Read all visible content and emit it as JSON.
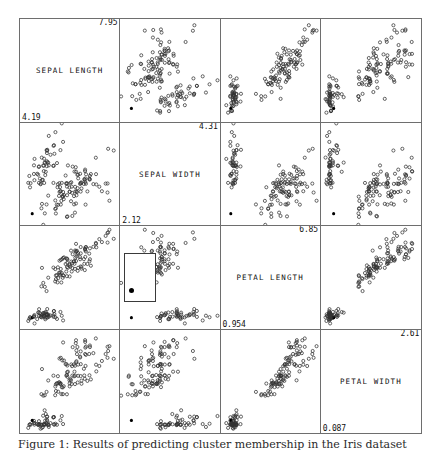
{
  "figure": {
    "caption": "Figure 1: Results of predicting cluster membership in the Iris dataset",
    "marker_style": "open-circle",
    "highlight_marker_style": "filled-circle",
    "border_color": "#6e6e6e",
    "marker_color": "#333333",
    "highlight_color": "#000000",
    "background": "#ffffff"
  },
  "chart_data": {
    "type": "scatter",
    "title": "",
    "layout": "scatter-plot-matrix",
    "grid": [
      4,
      4
    ],
    "grid_on": false,
    "legend": "none",
    "variables": [
      {
        "key": "sepal_length",
        "label": "SEPAL LENGTH",
        "min": "4.19",
        "max": "7.95",
        "min_value": 4.19,
        "max_value": 7.95
      },
      {
        "key": "sepal_width",
        "label": "SEPAL WIDTH",
        "min": "2.12",
        "max": "4.31",
        "min_value": 2.12,
        "max_value": 4.31
      },
      {
        "key": "petal_length",
        "label": "PETAL LENGTH",
        "min": "0.954",
        "max": "6.85",
        "min_value": 0.954,
        "max_value": 6.85
      },
      {
        "key": "petal_width",
        "label": "PETAL WIDTH",
        "min": "0.087",
        "max": "2.61",
        "min_value": 0.087,
        "max_value": 2.61
      }
    ],
    "points": {
      "sepal_length": [
        5.1,
        4.9,
        4.7,
        4.6,
        5.0,
        5.4,
        4.6,
        5.0,
        4.4,
        4.9,
        5.4,
        4.8,
        4.8,
        4.3,
        5.8,
        5.7,
        5.4,
        5.1,
        5.7,
        5.1,
        5.4,
        5.1,
        4.6,
        5.1,
        4.8,
        5.0,
        5.0,
        5.2,
        5.2,
        4.7,
        4.8,
        5.4,
        5.2,
        5.5,
        4.9,
        5.0,
        5.5,
        4.9,
        4.4,
        5.1,
        5.0,
        4.5,
        4.4,
        5.0,
        5.1,
        4.8,
        5.1,
        4.6,
        5.3,
        5.0,
        7.0,
        6.4,
        6.9,
        5.5,
        6.5,
        5.7,
        6.3,
        4.9,
        6.6,
        5.2,
        5.0,
        5.9,
        6.0,
        6.1,
        5.6,
        6.7,
        5.6,
        5.8,
        6.2,
        5.6,
        5.9,
        6.1,
        6.3,
        6.1,
        6.4,
        6.6,
        6.8,
        6.7,
        6.0,
        5.7,
        5.5,
        5.5,
        5.8,
        6.0,
        5.4,
        6.0,
        6.7,
        6.3,
        5.6,
        5.5,
        5.5,
        6.1,
        5.8,
        5.0,
        5.6,
        5.7,
        5.7,
        6.2,
        5.1,
        5.7,
        6.3,
        5.8,
        7.1,
        6.3,
        6.5,
        7.6,
        4.9,
        7.3,
        6.7,
        7.2,
        6.5,
        6.4,
        6.8,
        5.7,
        5.8,
        6.4,
        6.5,
        7.7,
        7.7,
        6.0,
        6.9,
        5.6,
        7.7,
        6.3,
        6.7,
        7.2,
        6.2,
        6.1,
        6.4,
        7.2,
        7.4,
        7.9,
        6.4,
        6.3,
        6.1,
        7.7,
        6.3,
        6.4,
        6.0,
        6.9,
        6.7,
        6.9,
        5.8,
        6.8,
        6.7,
        6.7,
        6.3,
        6.5,
        6.2,
        5.9
      ],
      "sepal_width": [
        3.5,
        3.0,
        3.2,
        3.1,
        3.6,
        3.9,
        3.4,
        3.4,
        2.9,
        3.1,
        3.7,
        3.4,
        3.0,
        3.0,
        4.0,
        4.4,
        3.9,
        3.5,
        3.8,
        3.8,
        3.4,
        3.7,
        3.6,
        3.3,
        3.4,
        3.0,
        3.4,
        3.5,
        3.4,
        3.2,
        3.1,
        3.4,
        4.1,
        4.2,
        3.1,
        3.2,
        3.5,
        3.6,
        3.0,
        3.4,
        3.5,
        2.3,
        3.2,
        3.5,
        3.8,
        3.0,
        3.8,
        3.2,
        3.7,
        3.3,
        3.2,
        3.2,
        3.1,
        2.3,
        2.8,
        2.8,
        3.3,
        2.4,
        2.9,
        2.7,
        2.0,
        3.0,
        2.2,
        2.9,
        2.9,
        3.1,
        3.0,
        2.7,
        2.2,
        2.5,
        3.2,
        2.8,
        2.5,
        2.8,
        2.9,
        3.0,
        2.8,
        3.0,
        2.9,
        2.6,
        2.4,
        2.4,
        2.7,
        2.7,
        3.0,
        3.4,
        3.1,
        2.3,
        3.0,
        2.5,
        2.6,
        3.0,
        2.6,
        2.3,
        2.7,
        3.0,
        2.9,
        2.9,
        2.5,
        2.8,
        3.3,
        2.7,
        3.0,
        2.9,
        3.0,
        3.0,
        2.5,
        2.9,
        2.5,
        3.6,
        3.2,
        2.7,
        3.0,
        2.5,
        2.8,
        3.2,
        3.0,
        3.8,
        2.6,
        2.2,
        3.2,
        2.8,
        2.8,
        2.7,
        3.3,
        3.2,
        2.8,
        3.0,
        2.8,
        3.0,
        2.8,
        3.8,
        2.8,
        2.8,
        2.6,
        3.0,
        3.4,
        3.1,
        3.0,
        3.1,
        3.1,
        3.1,
        2.7,
        3.2,
        3.3,
        3.0,
        2.5,
        3.0,
        3.4,
        3.0
      ],
      "petal_length": [
        1.4,
        1.4,
        1.3,
        1.5,
        1.4,
        1.7,
        1.4,
        1.5,
        1.4,
        1.5,
        1.5,
        1.6,
        1.4,
        1.1,
        1.2,
        1.5,
        1.3,
        1.4,
        1.7,
        1.5,
        1.7,
        1.5,
        1.0,
        1.7,
        1.9,
        1.6,
        1.6,
        1.5,
        1.4,
        1.6,
        1.6,
        1.5,
        1.5,
        1.4,
        1.5,
        1.2,
        1.3,
        1.4,
        1.3,
        1.5,
        1.3,
        1.3,
        1.3,
        1.6,
        1.9,
        1.4,
        1.6,
        1.4,
        1.5,
        1.4,
        4.7,
        4.5,
        4.9,
        4.0,
        4.6,
        4.5,
        4.7,
        3.3,
        4.6,
        3.9,
        3.5,
        4.2,
        4.0,
        4.7,
        3.6,
        4.4,
        4.5,
        4.1,
        4.5,
        3.9,
        4.8,
        4.0,
        4.9,
        4.7,
        4.3,
        4.4,
        4.8,
        5.0,
        4.5,
        3.5,
        3.8,
        3.7,
        3.9,
        5.1,
        4.5,
        4.5,
        4.7,
        4.4,
        4.1,
        4.0,
        4.4,
        4.6,
        4.0,
        3.3,
        4.2,
        4.2,
        4.2,
        4.3,
        3.0,
        4.1,
        6.0,
        5.1,
        5.9,
        5.6,
        5.8,
        6.6,
        4.5,
        6.3,
        5.8,
        6.1,
        5.1,
        5.3,
        5.5,
        5.0,
        5.1,
        5.3,
        5.5,
        6.7,
        6.9,
        5.0,
        5.7,
        4.9,
        6.7,
        4.9,
        5.7,
        6.0,
        4.8,
        4.9,
        5.6,
        5.8,
        6.1,
        6.4,
        5.6,
        5.1,
        5.6,
        6.1,
        5.6,
        5.5,
        4.8,
        5.4,
        5.6,
        5.1,
        5.1,
        5.9,
        5.7,
        5.2,
        5.0,
        5.2,
        5.4,
        5.1
      ],
      "petal_width": [
        0.2,
        0.2,
        0.2,
        0.2,
        0.2,
        0.4,
        0.3,
        0.2,
        0.2,
        0.1,
        0.2,
        0.2,
        0.1,
        0.1,
        0.2,
        0.4,
        0.4,
        0.3,
        0.3,
        0.3,
        0.2,
        0.4,
        0.2,
        0.5,
        0.2,
        0.2,
        0.4,
        0.2,
        0.2,
        0.2,
        0.2,
        0.4,
        0.1,
        0.2,
        0.2,
        0.2,
        0.2,
        0.1,
        0.2,
        0.2,
        0.3,
        0.3,
        0.2,
        0.6,
        0.4,
        0.3,
        0.2,
        0.2,
        0.2,
        0.2,
        1.4,
        1.5,
        1.5,
        1.3,
        1.5,
        1.3,
        1.6,
        1.0,
        1.3,
        1.4,
        1.0,
        1.5,
        1.0,
        1.4,
        1.3,
        1.4,
        1.5,
        1.0,
        1.5,
        1.1,
        1.8,
        1.3,
        1.5,
        1.2,
        1.3,
        1.4,
        1.4,
        1.7,
        1.5,
        1.0,
        1.1,
        1.0,
        1.2,
        1.6,
        1.5,
        1.6,
        1.5,
        1.3,
        1.3,
        1.3,
        1.2,
        1.4,
        1.2,
        1.0,
        1.3,
        1.2,
        1.3,
        1.3,
        1.1,
        1.3,
        2.5,
        1.9,
        2.1,
        1.8,
        2.2,
        2.1,
        1.7,
        1.8,
        1.8,
        2.5,
        2.0,
        1.9,
        2.1,
        2.0,
        2.4,
        2.3,
        1.8,
        2.2,
        2.3,
        1.5,
        2.3,
        2.0,
        2.0,
        1.8,
        2.1,
        1.8,
        1.8,
        1.8,
        2.1,
        1.6,
        1.9,
        2.0,
        2.2,
        1.5,
        1.4,
        2.3,
        2.4,
        1.8,
        1.8,
        2.1,
        2.4,
        2.3,
        1.9,
        2.3,
        2.5,
        2.3,
        1.9,
        2.0,
        2.3,
        1.8
      ]
    },
    "highlighted_point_index": 41,
    "brush": {
      "cell_row": 2,
      "cell_col": 1,
      "left_pct": 4,
      "top_pct": 26,
      "width_pct": 32,
      "height_pct": 48,
      "dot_left_pct": 12,
      "dot_top_pct": 72
    }
  }
}
